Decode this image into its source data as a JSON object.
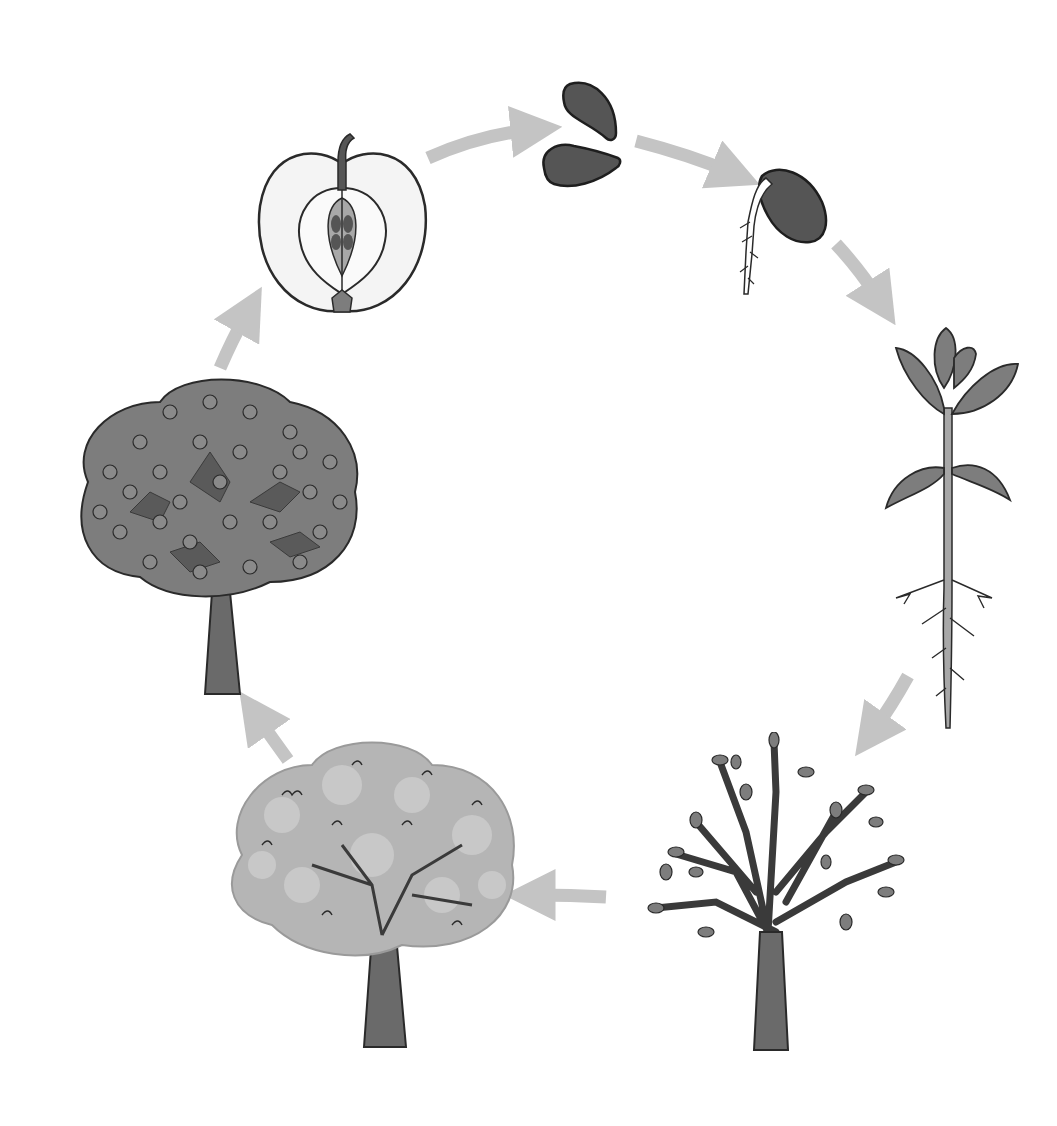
{
  "diagram": {
    "type": "cycle",
    "direction": "clockwise",
    "stages": [
      {
        "id": "apple-cross-section",
        "order": 1
      },
      {
        "id": "seeds",
        "order": 2
      },
      {
        "id": "germinating-seed",
        "order": 3
      },
      {
        "id": "seedling",
        "order": 4
      },
      {
        "id": "young-tree",
        "order": 5
      },
      {
        "id": "flowering-tree",
        "order": 6
      },
      {
        "id": "fruiting-tree",
        "order": 7
      }
    ],
    "arrows": [
      {
        "from": "apple-cross-section",
        "to": "seeds"
      },
      {
        "from": "seeds",
        "to": "germinating-seed"
      },
      {
        "from": "germinating-seed",
        "to": "seedling"
      },
      {
        "from": "seedling",
        "to": "young-tree"
      },
      {
        "from": "young-tree",
        "to": "flowering-tree"
      },
      {
        "from": "flowering-tree",
        "to": "fruiting-tree"
      },
      {
        "from": "fruiting-tree",
        "to": "apple-cross-section"
      }
    ]
  },
  "colors": {
    "background": "#ffffff",
    "arrow": "#c4c4c4",
    "outline": "#2a2a2a",
    "dark_fill": "#555555",
    "mid_fill": "#7d7d7d",
    "light_fill": "#a8a8a8",
    "blossom_fill": "#b5b5b5",
    "apple_flesh": "#f4f4f4"
  }
}
